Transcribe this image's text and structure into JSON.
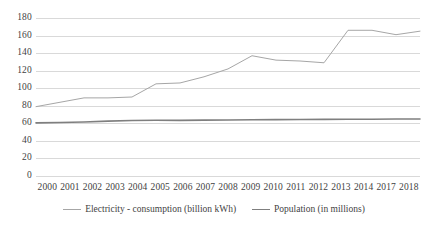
{
  "chart_data": {
    "type": "line",
    "title": "",
    "xlabel": "",
    "ylabel": "",
    "ylim": [
      0,
      180
    ],
    "ytick_step": 20,
    "yticks": [
      "180",
      "160",
      "140",
      "120",
      "100",
      "80",
      "60",
      "40",
      "20",
      "0"
    ],
    "grid": true,
    "grid_axis": "y",
    "legend_position": "bottom",
    "categories": [
      "2000",
      "2001",
      "2002",
      "2003",
      "2004",
      "2005",
      "2006",
      "2007",
      "2008",
      "2009",
      "2010",
      "2011",
      "2012",
      "2013",
      "2014",
      "2017",
      "2018"
    ],
    "series": [
      {
        "name": "Electricity - consumption (billion kWh)",
        "color": "#a6a6a6",
        "line_width": 1,
        "values": [
          79,
          84,
          89,
          89,
          90,
          105,
          106,
          113,
          122,
          137,
          132,
          131,
          129,
          166,
          166,
          161,
          165
        ]
      },
      {
        "name": "Population (in millions)",
        "color": "#7f7f7f",
        "line_width": 1.6,
        "values": [
          60.5,
          61,
          61.5,
          62.5,
          63.2,
          63.5,
          63.4,
          63.6,
          63.8,
          64,
          64.2,
          64.4,
          64.5,
          64.6,
          64.7,
          64.9,
          65
        ]
      }
    ]
  },
  "colors": {
    "background": "#ffffff",
    "gridline": "#d9d9d9",
    "text": "#3f3f3f",
    "electricity": "#a6a6a6",
    "population": "#7f7f7f"
  }
}
